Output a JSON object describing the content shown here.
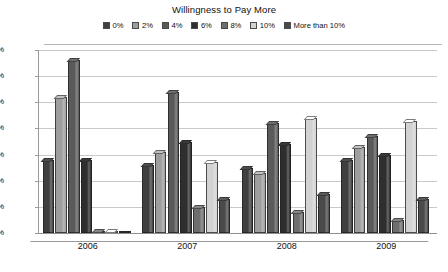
{
  "chart_data": {
    "type": "bar",
    "title": "Willingness to Pay More",
    "subtitle": "",
    "xlabel": "",
    "ylabel": "",
    "categories": [
      "2006",
      "2007",
      "2008",
      "2009"
    ],
    "ylim": [
      0,
      35
    ],
    "ytick_labels": [
      "0%",
      "5%",
      "10%",
      "15%",
      "20%",
      "25%",
      "30%",
      "35%"
    ],
    "ytick_values": [
      0,
      5,
      10,
      15,
      20,
      25,
      30,
      35
    ],
    "grid": true,
    "legend_position": "top",
    "series": [
      {
        "name": "0%",
        "color": "#3f3f3f",
        "values": [
          14.0,
          13.0,
          12.5,
          14.0
        ]
      },
      {
        "name": "2%",
        "color": "#9e9e9e",
        "values": [
          26.0,
          15.5,
          11.5,
          16.5
        ]
      },
      {
        "name": "4%",
        "color": "#5a5a5a",
        "values": [
          33.0,
          27.0,
          21.0,
          18.5
        ]
      },
      {
        "name": "6%",
        "color": "#2e2e2e",
        "values": [
          14.0,
          17.5,
          17.0,
          15.0
        ]
      },
      {
        "name": "8%",
        "color": "#6e6e6e",
        "values": [
          0.4,
          5.0,
          4.0,
          2.5
        ]
      },
      {
        "name": "10%",
        "color": "#d2d2d2",
        "values": [
          0.4,
          13.5,
          22.0,
          21.5
        ]
      },
      {
        "name": "More than 10%",
        "color": "#4a4a4a",
        "values": [
          0.0,
          6.5,
          7.5,
          6.5
        ]
      }
    ]
  }
}
